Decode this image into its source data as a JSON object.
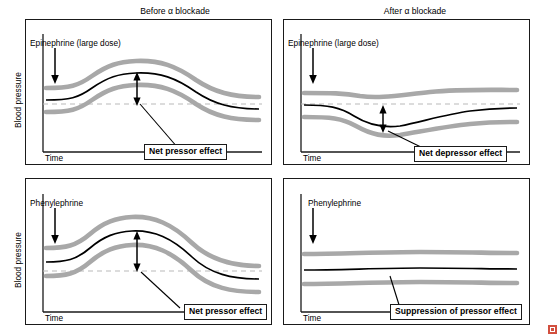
{
  "title": "",
  "columns": [
    {
      "label": "Before α blockade"
    },
    {
      "label": "After α blockade"
    }
  ],
  "axes": {
    "y_label": "Blood pressure",
    "x_label": "Time"
  },
  "panels": [
    {
      "id": "top-left",
      "drug_label": "Epinephrine (large dose)",
      "callout": "Net pressor effect",
      "arrow_direction": "up-down",
      "description": "Mean pressure rises above baseline"
    },
    {
      "id": "top-right",
      "drug_label": "Epinephrine (large dose)",
      "callout": "Net depressor effect",
      "arrow_direction": "up-down",
      "description": "Mean pressure falls below baseline"
    },
    {
      "id": "bottom-left",
      "drug_label": "Phenylephrine",
      "callout": "Net pressor effect",
      "arrow_direction": "up-down",
      "description": "Mean pressure rises above baseline"
    },
    {
      "id": "bottom-right",
      "drug_label": "Phenylephrine",
      "callout": "Suppression of pressor effect",
      "arrow_direction": "none",
      "description": "Flat trace, no pressor response"
    }
  ],
  "colors": {
    "trace_mean": "#000000",
    "trace_envelope": "#a8a8a8",
    "baseline": "#b9b9b9",
    "panel_border": "#1a1a1a",
    "corner_marker": "#d24f3f"
  },
  "icons": {
    "drug_arrow": "down-arrow-icon",
    "effect_arrow": "double-arrow-icon",
    "corner": "resize-corner-icon"
  }
}
